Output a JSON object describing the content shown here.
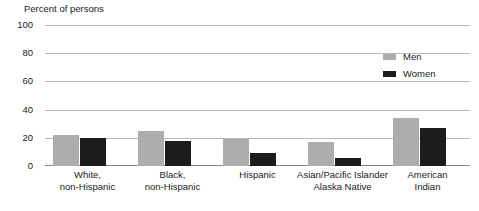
{
  "chart_data": {
    "type": "bar",
    "title": "Percent of persons",
    "xlabel": "",
    "ylabel": "Percent of persons",
    "ylim": [
      0,
      100
    ],
    "yticks": [
      0,
      20,
      40,
      60,
      80,
      100
    ],
    "grid": true,
    "legend_position": "top-right",
    "categories": [
      "White,\nnon-Hispanic",
      "Black,\nnon-Hispanic",
      "Hispanic",
      "Asian/Pacific Islander\nAlaska Native",
      "American\nIndian"
    ],
    "category_lines": [
      [
        "White,",
        "non-Hispanic"
      ],
      [
        "Black,",
        "non-Hispanic"
      ],
      [
        "Hispanic",
        ""
      ],
      [
        "Asian/Pacific Islander",
        "Alaska Native"
      ],
      [
        "American",
        "Indian"
      ]
    ],
    "series": [
      {
        "name": "Men",
        "color": "#adadad",
        "values": [
          22,
          25,
          19,
          17,
          34
        ]
      },
      {
        "name": "Women",
        "color": "#1c1c1c",
        "values": [
          20,
          18,
          9,
          6,
          27
        ]
      }
    ]
  },
  "legend": {
    "items": [
      {
        "label": "Men",
        "color": "#adadad"
      },
      {
        "label": "Women",
        "color": "#1c1c1c"
      }
    ]
  },
  "colors": {
    "men": "#adadad",
    "women": "#1c1c1c",
    "gridline": "#b8b8b8",
    "axis": "#8a8a8a",
    "text": "#1a1a1a",
    "background": "#ffffff"
  }
}
